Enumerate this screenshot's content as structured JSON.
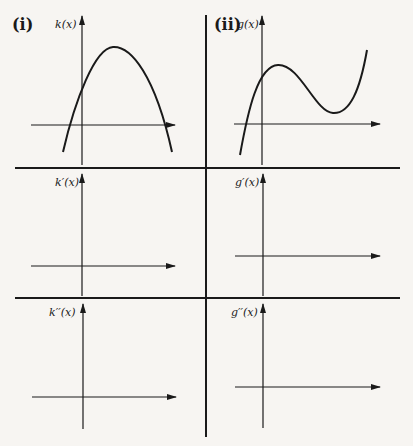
{
  "panels": {
    "i": {
      "part_label": "(i)",
      "top_label": "k(x)",
      "mid_label": "k′(x)",
      "bot_label": "k′′(x)"
    },
    "ii": {
      "part_label": "(ii)",
      "top_label": "g(x)",
      "mid_label": "g′(x)",
      "bot_label": "g′′(x)"
    }
  },
  "colors": {
    "ink": "#1a1a1a",
    "background": "#f7f5f2"
  }
}
